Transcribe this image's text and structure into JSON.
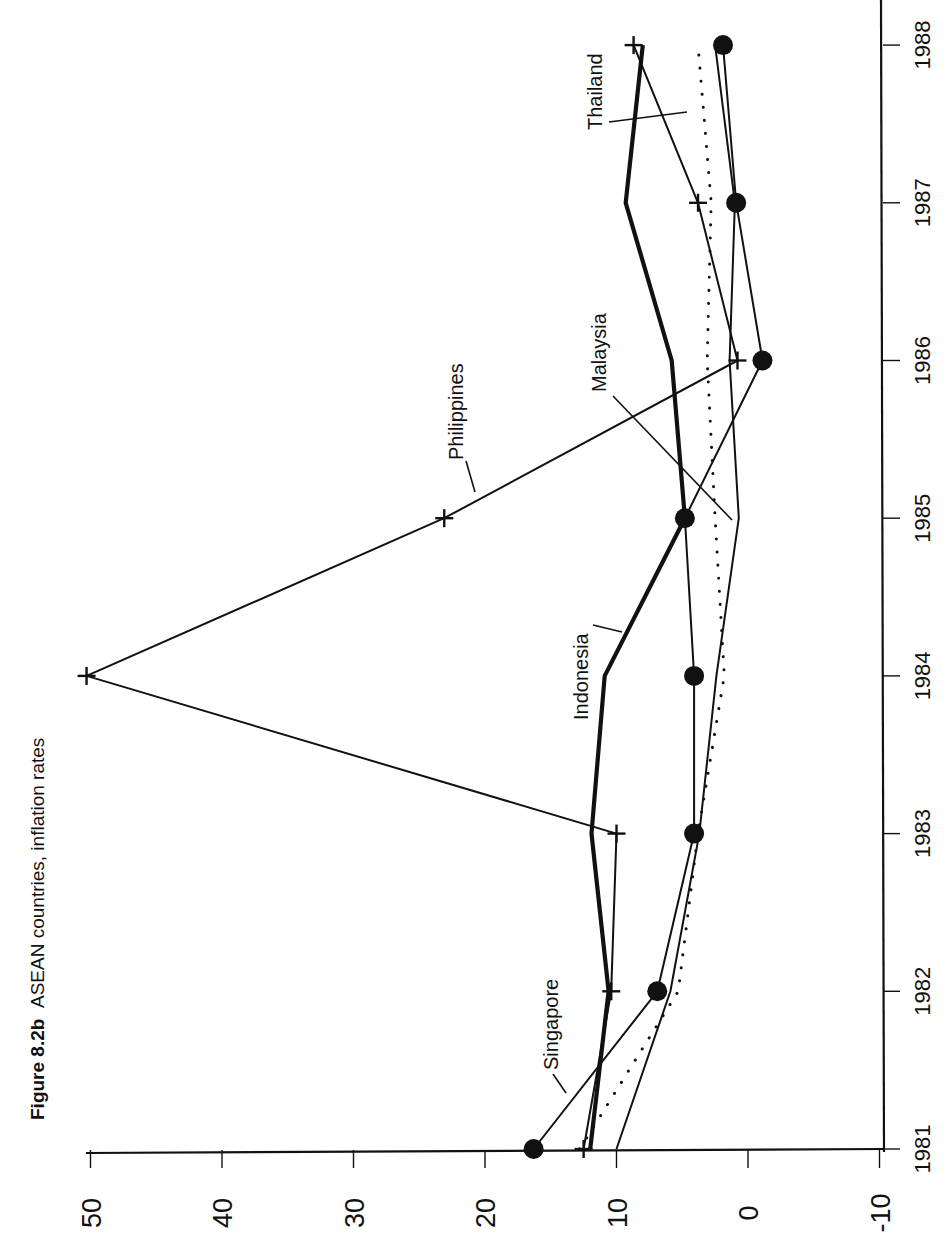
{
  "figure": {
    "number_label": "Figure 8.2b",
    "title_text": "ASEAN countries, inflation rates",
    "orientation": "rotated 90 degrees counter-clockwise"
  },
  "chart_data": {
    "type": "line",
    "title": "Figure 8.2b ASEAN countries, inflation rates",
    "xlabel": "",
    "ylabel": "",
    "x": [
      1981,
      1982,
      1983,
      1984,
      1985,
      1986,
      1987,
      1988
    ],
    "x_tick_labels": [
      "1981",
      "1982",
      "1983",
      "1984",
      "1985",
      "1986",
      "1987",
      "1988"
    ],
    "ylim": [
      -10,
      50
    ],
    "y_ticks": [
      50,
      40,
      30,
      20,
      10,
      0,
      -10
    ],
    "y_tick_labels": [
      "50",
      "40",
      "30",
      "20",
      "10",
      "0",
      "-10"
    ],
    "grid": false,
    "legend": "inline labels",
    "series": [
      {
        "name": "Indonesia",
        "style": "thick",
        "marker": "none",
        "values": [
          12.0,
          10.6,
          11.9,
          10.9,
          4.8,
          5.8,
          9.3,
          8.0
        ]
      },
      {
        "name": "Philippines",
        "style": "solid",
        "marker": "plus",
        "values": [
          12.5,
          10.4,
          10.0,
          50.3,
          23.1,
          0.8,
          3.8,
          8.7
        ]
      },
      {
        "name": "Singapore",
        "style": "solid",
        "marker": "circle",
        "values": [
          16.3,
          6.9,
          4.1,
          4.1,
          4.8,
          -1.1,
          0.9,
          1.9
        ]
      },
      {
        "name": "Malaysia",
        "style": "solid",
        "marker": "none",
        "values": [
          10.0,
          5.9,
          3.7,
          2.4,
          0.7,
          1.4,
          1.0,
          2.5
        ]
      },
      {
        "name": "Thailand",
        "style": "dotted",
        "marker": "none",
        "values": [
          12.8,
          5.3,
          3.8,
          1.8,
          2.5,
          3.1,
          2.8,
          3.8
        ]
      }
    ],
    "annotations": [
      "Indonesia",
      "Philippines",
      "Singapore",
      "Malaysia",
      "Thailand"
    ]
  }
}
